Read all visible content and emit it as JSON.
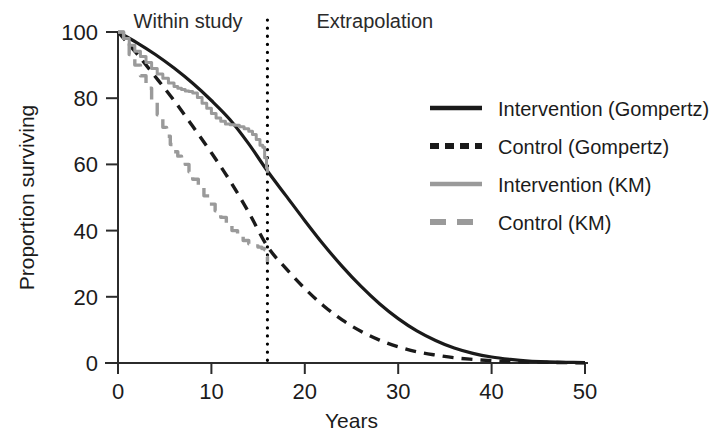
{
  "chart_data": {
    "type": "line",
    "title": "",
    "xlabel": "Years",
    "ylabel": "Proportion surviving",
    "xlim": [
      0,
      50
    ],
    "ylim": [
      0,
      100
    ],
    "xticks": [
      0,
      10,
      20,
      30,
      40,
      50
    ],
    "xtick_labels": [
      "0",
      "10",
      "20",
      "30",
      "40",
      "50"
    ],
    "yticks": [
      0,
      20,
      40,
      60,
      80,
      100
    ],
    "ytick_labels": [
      "0",
      "20",
      "40",
      "60",
      "80",
      "100"
    ],
    "grid": false,
    "legend_position": "right",
    "annotations": [
      {
        "name": "within-study-label",
        "text": "Within study",
        "x": 7.5,
        "y": 101
      },
      {
        "name": "extrapolation-label",
        "text": "Extrapolation",
        "x": 27.5,
        "y": 101
      }
    ],
    "vertical_reference_line": {
      "name": "study-cutoff-line",
      "x": 16,
      "style": "dotted",
      "color": "#000000",
      "label": "study follow-up cutoff"
    },
    "series": [
      {
        "name": "Intervention (Gompertz)",
        "key": "intervention_gompertz",
        "style": "solid",
        "color": "#1a1a1a",
        "width": 3.2,
        "x": [
          0,
          2,
          4,
          6,
          8,
          10,
          12,
          14,
          16,
          18,
          20,
          22,
          24,
          26,
          28,
          30,
          32,
          34,
          36,
          38,
          40,
          42,
          44,
          46,
          48,
          50
        ],
        "y": [
          100,
          96.8,
          93.2,
          89.1,
          84.5,
          79.3,
          73.5,
          66.2,
          58.0,
          50.5,
          43.0,
          35.8,
          29.2,
          23.2,
          17.9,
          13.4,
          9.7,
          6.8,
          4.5,
          2.9,
          1.8,
          1.1,
          0.6,
          0.35,
          0.2,
          0.1
        ]
      },
      {
        "name": "Control (Gompertz)",
        "key": "control_gompertz",
        "style": "dashed",
        "color": "#1a1a1a",
        "width": 3.4,
        "dash": "11,8",
        "x": [
          0,
          2,
          4,
          6,
          8,
          10,
          12,
          14,
          16,
          18,
          20,
          22,
          24,
          26,
          28,
          30,
          32,
          34,
          36,
          38,
          40,
          42,
          44,
          46,
          48,
          50
        ],
        "y": [
          100,
          93.5,
          86.5,
          79.3,
          71.5,
          63.5,
          55.0,
          45.5,
          35.2,
          28.5,
          22.5,
          17.3,
          13.0,
          9.6,
          6.9,
          4.9,
          3.4,
          2.4,
          1.6,
          1.1,
          0.7,
          0.45,
          0.3,
          0.2,
          0.12,
          0.06
        ]
      },
      {
        "name": "Intervention (KM)",
        "key": "intervention_km",
        "style": "solid",
        "color": "#9a9a9a",
        "width": 3.0,
        "x": [
          0,
          0.6,
          1.2,
          1.8,
          2.4,
          3.0,
          3.6,
          4.2,
          4.8,
          5.4,
          6.0,
          6.4,
          6.8,
          7.2,
          7.6,
          8.0,
          8.5,
          9.0,
          9.5,
          10.0,
          10.5,
          11.0,
          11.5,
          12.0,
          12.5,
          13.0,
          13.5,
          14.0,
          14.4,
          14.8,
          15.2,
          15.5,
          15.7,
          15.9,
          16.0
        ],
        "y": [
          100,
          98.0,
          96.0,
          94.2,
          92.6,
          90.8,
          89.0,
          87.3,
          86.0,
          84.6,
          83.5,
          83.0,
          82.6,
          82.2,
          82.0,
          81.6,
          80.2,
          78.5,
          77.0,
          75.4,
          74.0,
          73.0,
          72.2,
          72.0,
          71.8,
          71.4,
          70.8,
          70.0,
          69.0,
          67.5,
          65.8,
          65.2,
          62.0,
          59.0,
          57.5
        ]
      },
      {
        "name": "Control (KM)",
        "key": "control_km",
        "style": "dashed",
        "color": "#9a9a9a",
        "width": 3.4,
        "dash": "13,9",
        "x": [
          0,
          0.6,
          1.2,
          1.8,
          2.4,
          3.0,
          3.6,
          4.2,
          4.8,
          5.2,
          5.6,
          6.0,
          6.4,
          6.8,
          7.2,
          7.6,
          8.0,
          8.6,
          9.2,
          9.8,
          10.4,
          11.0,
          11.6,
          12.2,
          12.8,
          13.4,
          14.0,
          14.6,
          15.0,
          15.4,
          15.7,
          15.9,
          16.0
        ],
        "y": [
          100,
          96.5,
          93.2,
          90.0,
          86.8,
          83.0,
          79.0,
          75.0,
          71.2,
          68.5,
          66.0,
          63.8,
          62.5,
          62.0,
          60.0,
          57.8,
          55.5,
          53.0,
          50.5,
          48.0,
          46.0,
          44.0,
          42.0,
          40.0,
          38.4,
          37.0,
          36.0,
          35.4,
          35.0,
          34.6,
          34.2,
          32.0,
          30.5
        ]
      }
    ],
    "legend_entries": [
      {
        "label": "Intervention (Gompertz)",
        "style": "solid",
        "color": "#1a1a1a"
      },
      {
        "label": "Control (Gompertz)",
        "style": "dashed",
        "color": "#1a1a1a"
      },
      {
        "label": "Intervention (KM)",
        "style": "solid",
        "color": "#9a9a9a"
      },
      {
        "label": "Control (KM)",
        "style": "dashed",
        "color": "#9a9a9a"
      }
    ]
  },
  "axes": {
    "x_title": "Years",
    "y_title": "Proportion surviving"
  }
}
